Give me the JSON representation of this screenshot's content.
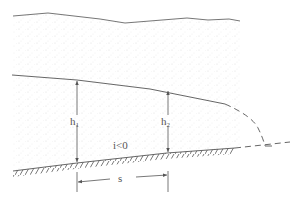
{
  "diagram": {
    "type": "open-channel gradually varied flow profile",
    "labels": {
      "h1": {
        "base": "h",
        "sub": "1"
      },
      "h2": {
        "base": "h",
        "sub": "2"
      },
      "slope": "i<0",
      "distance": "s"
    },
    "colors": {
      "line": "#555555",
      "stipple": "#d8d8d8",
      "background": "#ffffff"
    }
  }
}
